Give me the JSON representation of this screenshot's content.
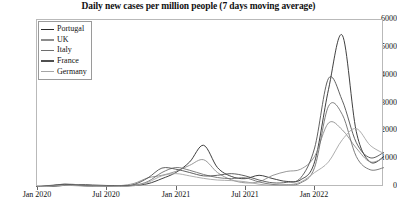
{
  "chart_data": {
    "type": "line",
    "title": "Daily new cases per million people (7 days moving average)",
    "xlabel": "",
    "ylabel": "",
    "ylim": [
      0,
      6000
    ],
    "yticks": [
      0,
      1000,
      2000,
      3000,
      4000,
      5000,
      6000
    ],
    "ytick_labels": [
      "0",
      "1000",
      "2000",
      "3000",
      "4000",
      "5000",
      "6000"
    ],
    "xtick_labels": [
      "Jan 2020",
      "Jul 2020",
      "Jan 2021",
      "Jul 2021",
      "Jan 2022"
    ],
    "xlim": [
      "Jan 2020",
      "Jul 2022"
    ],
    "grid": false,
    "legend_position": "upper left",
    "legend_entries": [
      "Portugal",
      "UK",
      "Italy",
      "France",
      "Germany"
    ],
    "colors": {
      "Portugal": "#2a2a2a",
      "UK": "#8c8c8c",
      "Italy": "#6e6e6e",
      "France": "#4f4f4f",
      "Germany": "#a5a5a5"
    },
    "x": [
      0.0,
      0.04,
      0.08,
      0.12,
      0.16,
      0.2,
      0.24,
      0.28,
      0.32,
      0.36,
      0.4,
      0.44,
      0.48,
      0.52,
      0.56,
      0.6,
      0.64,
      0.68,
      0.72,
      0.76,
      0.8,
      0.84,
      0.88,
      0.92,
      0.96,
      1.0
    ],
    "series": [
      {
        "name": "Portugal",
        "values": [
          5,
          15,
          60,
          90,
          70,
          55,
          45,
          60,
          120,
          300,
          520,
          900,
          1500,
          700,
          380,
          300,
          420,
          300,
          200,
          260,
          900,
          3500,
          5450,
          2000,
          900,
          1100
        ]
      },
      {
        "name": "UK",
        "values": [
          10,
          40,
          110,
          80,
          50,
          40,
          50,
          130,
          330,
          420,
          560,
          780,
          980,
          520,
          260,
          150,
          190,
          420,
          560,
          640,
          1100,
          2300,
          2050,
          1400,
          900,
          1050
        ]
      },
      {
        "name": "Italy",
        "values": [
          8,
          60,
          100,
          60,
          30,
          20,
          25,
          60,
          200,
          520,
          700,
          600,
          450,
          340,
          300,
          330,
          180,
          90,
          80,
          150,
          700,
          2900,
          2600,
          1100,
          620,
          700
        ]
      },
      {
        "name": "France",
        "values": [
          6,
          45,
          90,
          55,
          25,
          18,
          30,
          90,
          330,
          680,
          640,
          520,
          400,
          420,
          480,
          400,
          250,
          150,
          170,
          330,
          1400,
          3900,
          3100,
          1600,
          1050,
          1250
        ]
      },
      {
        "name": "Germany",
        "values": [
          4,
          25,
          60,
          40,
          20,
          12,
          18,
          45,
          170,
          400,
          480,
          400,
          310,
          250,
          230,
          190,
          100,
          60,
          70,
          180,
          520,
          900,
          1700,
          2100,
          1500,
          1200
        ]
      }
    ]
  }
}
